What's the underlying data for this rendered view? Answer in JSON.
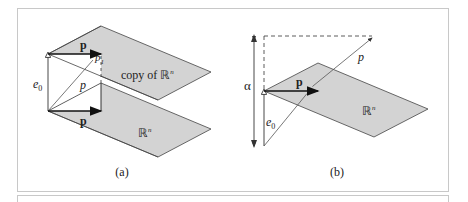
{
  "figure": {
    "panel_a": {
      "caption": "(a)",
      "upper_plane_label": "copy of ℝ",
      "upper_plane_sup": "n",
      "lower_plane_label": "ℝ",
      "lower_plane_sup": "n",
      "vector_top": "p",
      "vector_bottom": "p",
      "diag_label": "p",
      "e0_label": "e",
      "e0_sub": "0",
      "p1_label": "p",
      "p1_sub": "1"
    },
    "panel_b": {
      "caption": "(b)",
      "plane_label": "ℝ",
      "plane_sup": "n",
      "vector": "p",
      "diag_label": "p",
      "alpha_label": "α",
      "e0_label": "e",
      "e0_sub": "0"
    },
    "colors": {
      "plane_fill": "#d3d3d3",
      "stroke": "#333333",
      "frame": "#c8c8c8"
    }
  }
}
